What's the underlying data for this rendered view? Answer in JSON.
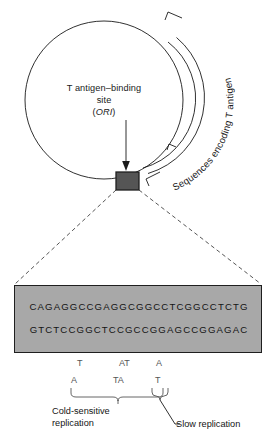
{
  "figure": {
    "colors": {
      "box_fill": "#a8a8a8",
      "box_stroke": "#1f1f1f",
      "marker_fill": "#555555",
      "line": "#1a1a1a",
      "mutation_text": "#555555"
    }
  },
  "circle": {
    "center_label_line1": "T antigen–binding",
    "center_label_line2": "site",
    "center_label_line3": "(ORI)",
    "center_label_ori": "ORI",
    "arc_label": "Sequences encoding T antigen",
    "marker_name": "ori-site-marker"
  },
  "sequence_box": {
    "top_strand": "CAGAGGCCGAGGCGGCCTCGGCCTCTG",
    "bottom_strand": "GTCTCCGGCTCCGCCGGAGCCGGAGAC",
    "top_arrow_direction": "right",
    "bottom_arrow_direction": "left"
  },
  "mutations": {
    "upper_row": [
      {
        "base": "T",
        "x": 77
      },
      {
        "base": "AT",
        "x": 119
      },
      {
        "base": "A",
        "x": 156
      }
    ],
    "lower_row": [
      {
        "base": "A",
        "x": 71
      },
      {
        "base": "TA",
        "x": 113
      },
      {
        "base": "T",
        "x": 155
      }
    ]
  },
  "captions": {
    "cold_sensitive_line1": "Cold-sensitive",
    "cold_sensitive_line2": "replication",
    "slow_replication": "Slow replication"
  }
}
